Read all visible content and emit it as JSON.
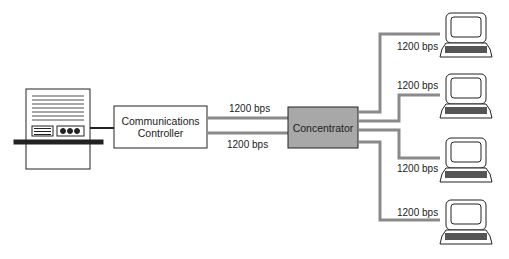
{
  "nodes": {
    "controller": {
      "label_line1": "Communications",
      "label_line2": "Controller"
    },
    "concentrator": {
      "label": "Concentrator",
      "fill": "#a8a8a8"
    }
  },
  "links": {
    "host_lines": [
      {
        "label": "1200 bps"
      },
      {
        "label": "1200 bps"
      }
    ],
    "terminal_lines": [
      {
        "label": "1200 bps"
      },
      {
        "label": "1200 bps"
      },
      {
        "label": "1200 bps"
      },
      {
        "label": "1200 bps"
      }
    ]
  },
  "colors": {
    "line": "#8a8a8a",
    "stroke": "#222222"
  }
}
